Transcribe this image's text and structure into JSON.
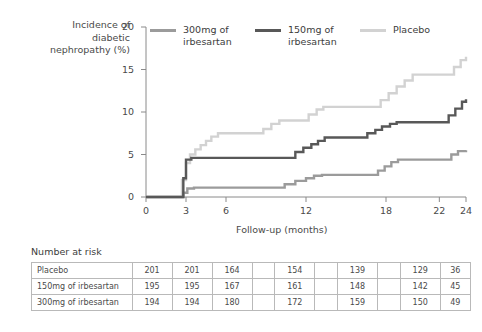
{
  "chart_data": {
    "type": "line",
    "title": "",
    "xlabel": "Follow-up (months)",
    "ylabel": "Incidence of\ndiabetic\nnephropathy (%)",
    "xlim": [
      0,
      24
    ],
    "ylim": [
      0,
      20
    ],
    "xticks": [
      0,
      3,
      6,
      12,
      18,
      22,
      24
    ],
    "xtick_labels": [
      "0",
      "3",
      "6",
      "12",
      "18",
      "22",
      "24"
    ],
    "yticks": [
      0,
      5,
      10,
      15,
      20
    ],
    "ytick_labels": [
      "0",
      "5",
      "10",
      "15",
      "20"
    ],
    "grid": false,
    "legend_position": "top",
    "step_type": "post",
    "series": [
      {
        "name": "300mg of\nirbesartan",
        "legend_label": "300mg of\nirbesartan",
        "color": "#9b9b9b",
        "points": [
          [
            0,
            0
          ],
          [
            2.5,
            0
          ],
          [
            2.8,
            0.5
          ],
          [
            3.1,
            1.0
          ],
          [
            3.6,
            1.1
          ],
          [
            9.8,
            1.1
          ],
          [
            10.4,
            1.5
          ],
          [
            11.2,
            1.9
          ],
          [
            12.0,
            2.2
          ],
          [
            12.6,
            2.5
          ],
          [
            13.2,
            2.6
          ],
          [
            16.8,
            2.6
          ],
          [
            17.4,
            3.1
          ],
          [
            17.9,
            3.6
          ],
          [
            18.4,
            4.1
          ],
          [
            18.9,
            4.4
          ],
          [
            22.4,
            4.4
          ],
          [
            22.9,
            5.0
          ],
          [
            23.4,
            5.4
          ],
          [
            24,
            5.5
          ]
        ]
      },
      {
        "name": "150mg of\nirbesartan",
        "legend_label": "150mg of\nirbesartan",
        "color": "#585858",
        "points": [
          [
            0,
            0
          ],
          [
            2.5,
            0
          ],
          [
            2.8,
            2.2
          ],
          [
            3.0,
            4.4
          ],
          [
            3.4,
            4.6
          ],
          [
            10.6,
            4.6
          ],
          [
            11.2,
            5.3
          ],
          [
            11.8,
            5.8
          ],
          [
            12.4,
            6.2
          ],
          [
            12.9,
            6.6
          ],
          [
            13.4,
            7.0
          ],
          [
            16.0,
            7.0
          ],
          [
            16.6,
            7.5
          ],
          [
            17.2,
            7.9
          ],
          [
            17.7,
            8.3
          ],
          [
            18.3,
            8.6
          ],
          [
            18.8,
            8.8
          ],
          [
            22.2,
            8.8
          ],
          [
            22.7,
            9.6
          ],
          [
            23.2,
            10.4
          ],
          [
            23.7,
            11.2
          ],
          [
            24,
            11.5
          ]
        ]
      },
      {
        "name": "Placebo",
        "legend_label": "Placebo",
        "color": "#d2d2d2",
        "points": [
          [
            0,
            0
          ],
          [
            2.4,
            0
          ],
          [
            2.7,
            2.0
          ],
          [
            3.0,
            4.0
          ],
          [
            3.3,
            5.0
          ],
          [
            3.7,
            5.6
          ],
          [
            4.1,
            6.1
          ],
          [
            4.5,
            6.6
          ],
          [
            4.9,
            7.1
          ],
          [
            5.4,
            7.5
          ],
          [
            8.2,
            7.5
          ],
          [
            8.8,
            8.0
          ],
          [
            9.4,
            8.6
          ],
          [
            10.0,
            9.0
          ],
          [
            11.6,
            9.0
          ],
          [
            12.2,
            9.7
          ],
          [
            12.8,
            10.3
          ],
          [
            13.3,
            10.6
          ],
          [
            17.0,
            10.6
          ],
          [
            17.6,
            11.4
          ],
          [
            18.2,
            12.2
          ],
          [
            18.8,
            13.0
          ],
          [
            19.4,
            13.7
          ],
          [
            20.0,
            14.4
          ],
          [
            22.6,
            14.4
          ],
          [
            23.1,
            15.3
          ],
          [
            23.6,
            16.1
          ],
          [
            24,
            16.5
          ]
        ]
      }
    ]
  },
  "risk_table": {
    "caption": "Number at risk",
    "column_positions": [
      0,
      3,
      6,
      9,
      12,
      15,
      18,
      21,
      22,
      24
    ],
    "rows": [
      {
        "label": "Placebo",
        "values": [
          "201",
          "201",
          "164",
          "",
          "154",
          "",
          "139",
          "",
          "129",
          "36"
        ]
      },
      {
        "label": "150mg of irbesartan",
        "values": [
          "195",
          "195",
          "167",
          "",
          "161",
          "",
          "148",
          "",
          "142",
          "45"
        ]
      },
      {
        "label": "300mg of irbesartan",
        "values": [
          "194",
          "194",
          "180",
          "",
          "172",
          "",
          "159",
          "",
          "150",
          "49"
        ]
      }
    ]
  },
  "colors": {
    "axis": "#8a8a8a",
    "text": "#4a4a4a",
    "table_border": "#b9b9b9",
    "background": "#ffffff"
  }
}
